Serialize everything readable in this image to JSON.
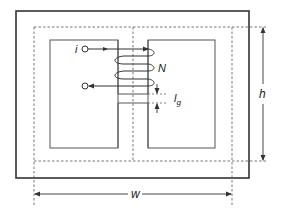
{
  "diagram": {
    "labels": {
      "current": "i",
      "turns": "N",
      "gap": "l",
      "gap_subscript": "g",
      "height": "h",
      "width": "w"
    },
    "colors": {
      "core_outline": "#333333",
      "window_outline": "#555555",
      "dashed_path": "#666666",
      "coil": "#333333",
      "arrow": "#333333",
      "background": "#ffffff"
    }
  }
}
